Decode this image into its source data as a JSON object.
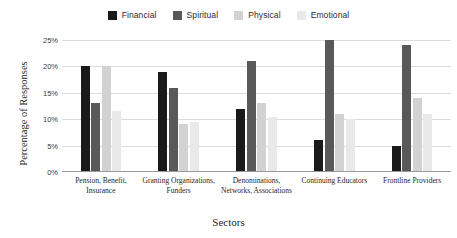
{
  "chart_data": {
    "type": "bar",
    "title": "",
    "xlabel": "Sectors",
    "ylabel": "Percentage of Responses",
    "ylim": [
      0,
      25
    ],
    "ytick_labels": [
      "0%",
      "5%",
      "10%",
      "15%",
      "20%",
      "25%"
    ],
    "ytick_values": [
      0,
      5,
      10,
      15,
      20,
      25
    ],
    "grid": true,
    "legend_position": "top-center",
    "categories": [
      "Pension, Benefit, Insurance",
      "Granting Organizations, Funders",
      "Denominations, Networks, Associations",
      "Continuing Educators",
      "Frontline Providers"
    ],
    "series": [
      {
        "name": "Financial",
        "color": "#1a1a1a",
        "values": [
          20,
          19,
          12,
          6,
          5
        ]
      },
      {
        "name": "Spiritual",
        "color": "#595959",
        "values": [
          13,
          16,
          21,
          25,
          24
        ]
      },
      {
        "name": "Physical",
        "color": "#d2d2d2",
        "values": [
          20,
          9,
          13,
          11,
          14
        ]
      },
      {
        "name": "Emotional",
        "color": "#e9e9e9",
        "values": [
          11.5,
          9.5,
          10.5,
          10,
          11
        ]
      }
    ]
  }
}
